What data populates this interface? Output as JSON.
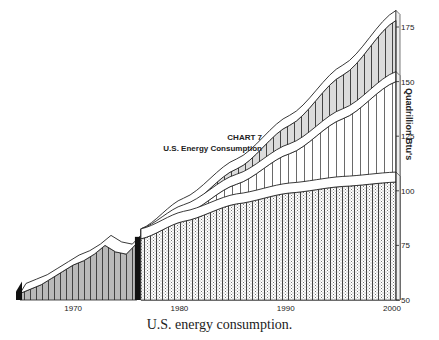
{
  "caption": "U.S. energy consumption.",
  "chart_title": {
    "line1": "CHART 7",
    "line2": "U.S. Energy Consumption"
  },
  "chart_data": {
    "type": "area",
    "title": "CHART 7 U.S. Energy Consumption",
    "xlabel": "",
    "ylabel": "Quadrillion Btu's",
    "xlim": [
      1965,
      2000
    ],
    "ylim": [
      50,
      178
    ],
    "x_ticks": [
      1970,
      1980,
      1990,
      2000
    ],
    "y_ticks": [
      50,
      75,
      100,
      125,
      150,
      175
    ],
    "y_axis_position": "right",
    "grid": false,
    "legend": "none",
    "style": "3D ribbon bands with vertical hatching",
    "series": [
      {
        "name": "Historical",
        "x": [
          1965,
          1966,
          1967,
          1968,
          1969,
          1970,
          1971,
          1972,
          1973,
          1974,
          1975,
          1976
        ],
        "values": [
          53,
          55,
          57,
          60,
          63,
          66,
          68,
          71,
          75,
          72,
          71,
          76
        ]
      },
      {
        "name": "Projection (low)",
        "x": [
          1976,
          1980,
          1985,
          1990,
          1995,
          2000
        ],
        "values": [
          78,
          86,
          94,
          99,
          102,
          104
        ]
      },
      {
        "name": "Projection (middle)",
        "x": [
          1976,
          1980,
          1985,
          1990,
          1995,
          2000
        ],
        "values": [
          78,
          89,
          103,
          117,
          133,
          150
        ]
      },
      {
        "name": "Projection (high)",
        "x": [
          1976,
          1980,
          1985,
          1990,
          1995,
          2000
        ],
        "values": [
          78,
          92,
          110,
          130,
          153,
          178
        ]
      }
    ]
  },
  "axis": {
    "x_tick_labels": [
      "1970",
      "1980",
      "1990",
      "2000"
    ],
    "y_tick_labels": [
      "50",
      "75",
      "100",
      "125",
      "150",
      "175"
    ],
    "y_title": "Quadrillion Btu's"
  }
}
